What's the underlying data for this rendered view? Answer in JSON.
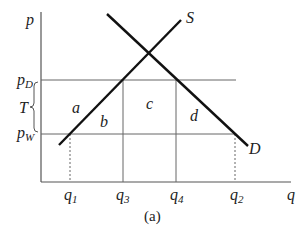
{
  "diagram": {
    "type": "supply-demand-tariff",
    "caption": "(a)",
    "axes": {
      "y_label": "p",
      "x_label": "q"
    },
    "price_labels": {
      "p_D": "p",
      "p_D_sub": "D",
      "p_W": "p",
      "p_W_sub": "W",
      "tariff": "T"
    },
    "quantity_labels": [
      {
        "main": "q",
        "sub": "1"
      },
      {
        "main": "q",
        "sub": "3"
      },
      {
        "main": "q",
        "sub": "4"
      },
      {
        "main": "q",
        "sub": "2"
      }
    ],
    "curve_labels": {
      "supply": "S",
      "demand": "D"
    },
    "area_labels": {
      "a": "a",
      "b": "b",
      "c": "c",
      "d": "d"
    }
  }
}
